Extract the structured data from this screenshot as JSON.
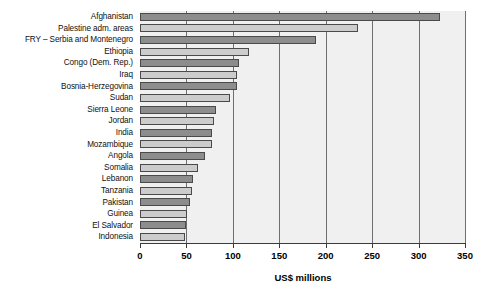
{
  "chart_data": {
    "type": "bar",
    "orientation": "horizontal",
    "title": "",
    "subtitle": "",
    "xlabel": "US$ millions",
    "ylabel": "",
    "xlim": [
      0,
      350
    ],
    "xticks": [
      0,
      50,
      100,
      150,
      200,
      250,
      300,
      350
    ],
    "xtick_labels": [
      "0",
      "50",
      "100",
      "150",
      "200",
      "250",
      "300",
      "350"
    ],
    "grid": true,
    "grid_axis": "x",
    "legend": null,
    "legend_position": "none",
    "categories": [
      "Afghanistan",
      "Palestine adm. areas",
      "FRY – Serbia and Montenegro",
      "Ethiopia",
      "Congo (Dem. Rep.)",
      "Iraq",
      "Bosnia-Herzegovina",
      "Sudan",
      "Sierra Leone",
      "Jordan",
      "India",
      "Mozambique",
      "Angola",
      "Somalia",
      "Lebanon",
      "Tanzania",
      "Pakistan",
      "Guinea",
      "El Salvador",
      "Indonesia"
    ],
    "values": [
      323,
      235,
      190,
      117,
      107,
      104,
      104,
      97,
      82,
      80,
      78,
      78,
      70,
      62,
      57,
      56,
      54,
      51,
      49,
      48
    ],
    "bar_colors": [
      "#8d8d8d",
      "#cccccc",
      "#8d8d8d",
      "#cccccc",
      "#8d8d8d",
      "#cccccc",
      "#8d8d8d",
      "#cccccc",
      "#8d8d8d",
      "#cccccc",
      "#8d8d8d",
      "#cccccc",
      "#8d8d8d",
      "#cccccc",
      "#8d8d8d",
      "#cccccc",
      "#8d8d8d",
      "#cccccc",
      "#8d8d8d",
      "#cccccc"
    ],
    "plot_background": "#f0f0f0",
    "bar_edge_color": "#4a4a4a",
    "axis_color": "#3b3b3b",
    "grid_color": "#6f6f6f"
  }
}
